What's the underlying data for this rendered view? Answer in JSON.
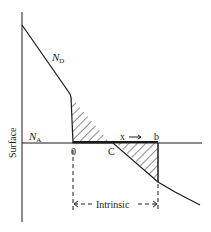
{
  "diagram": {
    "axis_label": "Surface",
    "curve_labels": {
      "donor": {
        "main": "N",
        "sub": "D"
      },
      "acceptor": {
        "main": "N",
        "sub": "A"
      }
    },
    "points": {
      "origin": "0",
      "crossing": "C",
      "end": "b"
    },
    "direction_label": "x",
    "region_label": "Intrinsic",
    "colors": {
      "line": "#1a1a1a",
      "background": "#ffffff"
    }
  }
}
